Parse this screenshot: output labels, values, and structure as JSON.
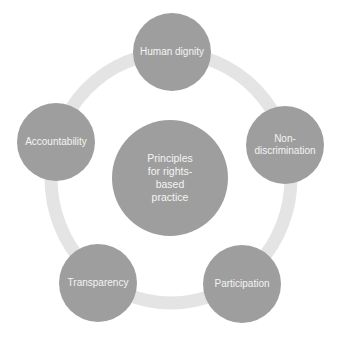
{
  "diagram": {
    "type": "radial-cycle",
    "colors": {
      "node_fill": "#9e9e9e",
      "ring": "#e4e4e4",
      "text": "#f4f4f4",
      "background": "#ffffff"
    },
    "center": {
      "label": "Principles\nfor rights-\nbased\npractice"
    },
    "nodes": [
      {
        "id": "human-dignity",
        "label": "Human dignity"
      },
      {
        "id": "non-discrimination",
        "label": "Non-\ndiscrimination"
      },
      {
        "id": "participation",
        "label": "Participation"
      },
      {
        "id": "transparency",
        "label": "Transparency"
      },
      {
        "id": "accountability",
        "label": "Accountability"
      }
    ]
  }
}
